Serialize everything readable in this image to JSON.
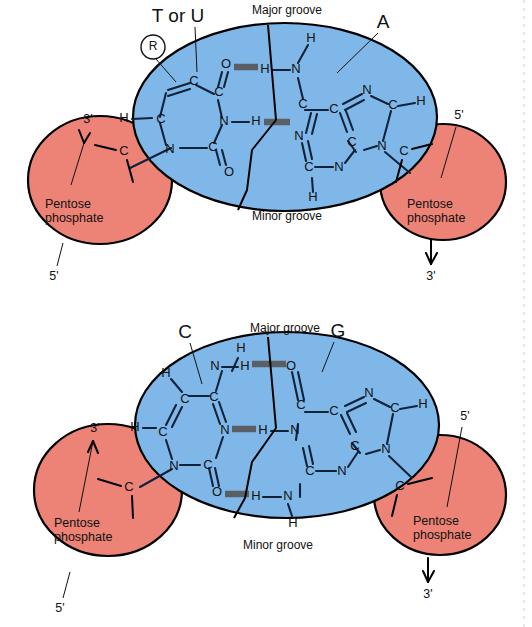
{
  "figure": {
    "colors": {
      "base_ellipse": "#7fb8e8",
      "pentose_phosphate": "#ec8376",
      "bond": "#11223a",
      "hydrogen_bond": "#5a5f66",
      "outline": "#000000",
      "background": "#ffffff"
    }
  },
  "pairs": [
    {
      "id": "at-pair",
      "left_base_label": "T or U",
      "right_base_label": "A",
      "ribose_marker": "R",
      "major_groove_label": "Major groove",
      "minor_groove_label": "Minor groove",
      "hydrogen_bond_count": 2,
      "left_sugar": {
        "line1": "Pentose",
        "line2": "phosphate",
        "top_prime": "3'",
        "bottom_prime": "5'",
        "atom": "C"
      },
      "right_sugar": {
        "line1": "Pentose",
        "line2": "phosphate",
        "top_prime": "5'",
        "bottom_prime": "3'",
        "atom": "C"
      },
      "left_base_atoms": [
        "C",
        "C",
        "C",
        "N",
        "N",
        "C",
        "C",
        "O",
        "O",
        "H",
        "H"
      ],
      "right_base_atoms": [
        "N",
        "C",
        "C",
        "N",
        "C",
        "C",
        "N",
        "N",
        "C",
        "H",
        "H",
        "H"
      ]
    },
    {
      "id": "gc-pair",
      "left_base_label": "C",
      "right_base_label": "G",
      "major_groove_label": "Major groove",
      "minor_groove_label": "Minor groove",
      "hydrogen_bond_count": 3,
      "left_sugar": {
        "line1": "Pentose",
        "line2": "phosphate",
        "top_prime": "3'",
        "bottom_prime": "5'",
        "atom": "C"
      },
      "right_sugar": {
        "line1": "Pentose",
        "line2": "phosphate",
        "top_prime": "5'",
        "bottom_prime": "3'",
        "atom": "C"
      },
      "left_base_atoms": [
        "N",
        "H",
        "C",
        "C",
        "C",
        "N",
        "N",
        "C",
        "O",
        "H",
        "H"
      ],
      "right_base_atoms": [
        "O",
        "C",
        "C",
        "N",
        "C",
        "C",
        "N",
        "N",
        "C",
        "N",
        "H",
        "H",
        "H"
      ]
    }
  ],
  "atoms": {
    "at": {
      "t_c_top_left": "C",
      "t_c_top_right": "C",
      "t_o_top": "O",
      "t_c_left": "C",
      "t_n_right": "N",
      "t_n_bottom_left": "N",
      "t_c_bottom": "C",
      "t_o_bottom": "O",
      "t_h_left": "H",
      "bridge_h_top": "H",
      "bridge_h_mid": "H",
      "a_n_top": "N",
      "a_h_top": "H",
      "a_c_upper": "C",
      "a_c_center": "C",
      "a_n_mid": "N",
      "a_n_upper_right": "N",
      "a_c_right": "C",
      "a_h_right": "H",
      "a_n_lower_right": "N",
      "a_c_lower": "C",
      "a_c_bottom": "C",
      "a_n_bottom": "N",
      "a_h_bottom": "H"
    },
    "gc": {
      "c_n_top": "N",
      "c_h_top": "H",
      "c_h_upper_left": "H",
      "c_c_upper": "C",
      "c_c_mid": "C",
      "c_c_left": "C",
      "c_h_left": "H",
      "c_n_mid": "N",
      "c_n_bottom_left": "N",
      "c_c_bottom": "C",
      "c_o_bottom": "O",
      "bridge_h_top": "H",
      "bridge_h_mid": "H",
      "bridge_h_bottom": "H",
      "g_o_top": "O",
      "g_c_upper": "C",
      "g_c_center": "C",
      "g_n_mid": "N",
      "g_n_upper_right": "N",
      "g_c_right": "C",
      "g_h_right": "H",
      "g_n_lower_right": "N",
      "g_c_lower": "C",
      "g_c_bottom": "C",
      "g_n_bottom": "N",
      "g_n_amine": "N",
      "g_h_amine": "H"
    }
  }
}
